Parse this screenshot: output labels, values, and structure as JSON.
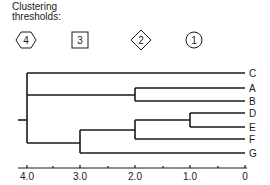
{
  "legend": {
    "title_line1": "Clustering",
    "title_line2": "thresholds:",
    "symbols": [
      {
        "shape": "hexagon",
        "label": "4",
        "threshold": 4.0
      },
      {
        "shape": "square",
        "label": "3",
        "threshold": 3.0
      },
      {
        "shape": "diamond",
        "label": "2",
        "threshold": 2.0
      },
      {
        "shape": "circle",
        "label": "1",
        "threshold": 1.0
      }
    ]
  },
  "dendrogram": {
    "leaves": [
      "C",
      "A",
      "B",
      "D",
      "E",
      "F",
      "G"
    ],
    "merges": [
      {
        "members": [
          "D",
          "E"
        ],
        "height": 1.0
      },
      {
        "members": [
          "A",
          "B"
        ],
        "height": 2.0
      },
      {
        "members": [
          "D",
          "E",
          "F"
        ],
        "height": 2.0
      },
      {
        "members": [
          "D",
          "E",
          "F",
          "G"
        ],
        "height": 3.0
      },
      {
        "members": [
          "C",
          "A",
          "B",
          "D",
          "E",
          "F",
          "G"
        ],
        "height": 4.0
      }
    ]
  },
  "axis": {
    "ticks": [
      "4.0",
      "3.0",
      "2.0",
      "1.0",
      "0"
    ],
    "range": [
      4.0,
      0
    ]
  }
}
